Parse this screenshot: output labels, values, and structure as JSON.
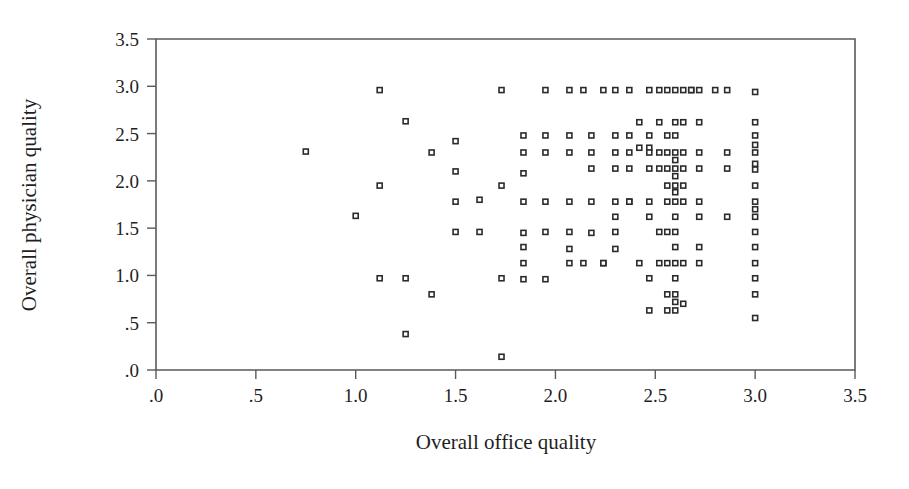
{
  "chart_data": {
    "type": "scatter",
    "title": "",
    "xlabel": "Overall office quality",
    "ylabel": "Overall physician quality",
    "xlim": [
      0,
      3.5
    ],
    "ylim": [
      0,
      3.5
    ],
    "xticks": [
      0,
      0.5,
      1.0,
      1.5,
      2.0,
      2.5,
      3.0,
      3.5
    ],
    "xticklabels": [
      ".0",
      ".5",
      "1.0",
      "1.5",
      "2.0",
      "2.5",
      "3.0",
      "3.5"
    ],
    "yticks": [
      0,
      0.5,
      1.0,
      1.5,
      2.0,
      2.5,
      3.0,
      3.5
    ],
    "yticklabels": [
      ".0",
      ".5",
      "1.0",
      "1.5",
      "2.0",
      "2.5",
      "3.0",
      "3.5"
    ],
    "grid": false,
    "legend": null,
    "marker": "open-square",
    "marker_size_px": 5,
    "marker_edge_color": "#2b2b2b",
    "marker_face_color": "#ffffff",
    "frame": "box",
    "frame_color": "#5a5a5a",
    "n_points": 196,
    "points": [
      [
        0.75,
        2.31
      ],
      [
        1.12,
        2.96
      ],
      [
        1.12,
        1.95
      ],
      [
        1.12,
        0.97
      ],
      [
        1.0,
        1.63
      ],
      [
        1.25,
        2.63
      ],
      [
        1.25,
        0.97
      ],
      [
        1.25,
        0.38
      ],
      [
        1.38,
        2.3
      ],
      [
        1.38,
        0.8
      ],
      [
        1.5,
        2.42
      ],
      [
        1.5,
        2.1
      ],
      [
        1.5,
        1.78
      ],
      [
        1.5,
        1.46
      ],
      [
        1.62,
        1.8
      ],
      [
        1.62,
        1.46
      ],
      [
        1.73,
        2.96
      ],
      [
        1.73,
        1.95
      ],
      [
        1.73,
        0.97
      ],
      [
        1.73,
        0.14
      ],
      [
        1.84,
        2.48
      ],
      [
        1.84,
        2.3
      ],
      [
        1.84,
        2.08
      ],
      [
        1.84,
        1.78
      ],
      [
        1.84,
        1.45
      ],
      [
        1.84,
        1.3
      ],
      [
        1.84,
        1.13
      ],
      [
        1.84,
        0.96
      ],
      [
        1.95,
        2.96
      ],
      [
        1.95,
        2.48
      ],
      [
        1.95,
        2.3
      ],
      [
        1.95,
        1.78
      ],
      [
        1.95,
        1.46
      ],
      [
        1.95,
        0.96
      ],
      [
        2.07,
        2.96
      ],
      [
        2.07,
        2.48
      ],
      [
        2.07,
        2.3
      ],
      [
        2.07,
        1.78
      ],
      [
        2.07,
        1.46
      ],
      [
        2.07,
        1.28
      ],
      [
        2.07,
        1.13
      ],
      [
        2.14,
        2.96
      ],
      [
        2.14,
        1.13
      ],
      [
        2.18,
        2.48
      ],
      [
        2.18,
        2.3
      ],
      [
        2.18,
        2.13
      ],
      [
        2.18,
        1.78
      ],
      [
        2.18,
        1.45
      ],
      [
        2.24,
        2.96
      ],
      [
        2.24,
        1.13
      ],
      [
        2.24,
        1.13
      ],
      [
        2.3,
        2.96
      ],
      [
        2.3,
        2.48
      ],
      [
        2.3,
        2.3
      ],
      [
        2.3,
        2.13
      ],
      [
        2.3,
        1.78
      ],
      [
        2.3,
        1.62
      ],
      [
        2.3,
        1.46
      ],
      [
        2.3,
        1.28
      ],
      [
        2.37,
        2.96
      ],
      [
        2.37,
        2.48
      ],
      [
        2.37,
        2.3
      ],
      [
        2.37,
        2.13
      ],
      [
        2.37,
        1.78
      ],
      [
        2.37,
        1.78
      ],
      [
        2.42,
        2.62
      ],
      [
        2.42,
        2.35
      ],
      [
        2.42,
        1.13
      ],
      [
        2.47,
        2.96
      ],
      [
        2.47,
        2.48
      ],
      [
        2.47,
        2.35
      ],
      [
        2.47,
        2.3
      ],
      [
        2.47,
        2.13
      ],
      [
        2.47,
        1.78
      ],
      [
        2.47,
        1.62
      ],
      [
        2.47,
        0.97
      ],
      [
        2.47,
        0.63
      ],
      [
        2.52,
        2.96
      ],
      [
        2.52,
        2.62
      ],
      [
        2.52,
        2.3
      ],
      [
        2.52,
        2.13
      ],
      [
        2.52,
        1.46
      ],
      [
        2.52,
        1.13
      ],
      [
        2.56,
        2.96
      ],
      [
        2.56,
        2.48
      ],
      [
        2.56,
        2.3
      ],
      [
        2.56,
        2.13
      ],
      [
        2.56,
        1.95
      ],
      [
        2.56,
        1.78
      ],
      [
        2.56,
        1.46
      ],
      [
        2.56,
        1.13
      ],
      [
        2.56,
        0.8
      ],
      [
        2.56,
        0.63
      ],
      [
        2.6,
        2.96
      ],
      [
        2.6,
        2.62
      ],
      [
        2.6,
        2.48
      ],
      [
        2.6,
        2.3
      ],
      [
        2.6,
        2.22
      ],
      [
        2.6,
        2.13
      ],
      [
        2.6,
        2.05
      ],
      [
        2.6,
        1.95
      ],
      [
        2.6,
        1.88
      ],
      [
        2.6,
        1.78
      ],
      [
        2.6,
        1.62
      ],
      [
        2.6,
        1.46
      ],
      [
        2.6,
        1.3
      ],
      [
        2.6,
        1.13
      ],
      [
        2.6,
        0.97
      ],
      [
        2.6,
        0.8
      ],
      [
        2.6,
        0.72
      ],
      [
        2.6,
        0.63
      ],
      [
        2.64,
        2.96
      ],
      [
        2.64,
        2.62
      ],
      [
        2.64,
        2.3
      ],
      [
        2.64,
        2.13
      ],
      [
        2.64,
        1.95
      ],
      [
        2.64,
        1.78
      ],
      [
        2.64,
        1.13
      ],
      [
        2.64,
        0.7
      ],
      [
        2.68,
        2.96
      ],
      [
        2.68,
        2.96
      ],
      [
        2.72,
        2.96
      ],
      [
        2.72,
        2.62
      ],
      [
        2.72,
        2.3
      ],
      [
        2.72,
        2.13
      ],
      [
        2.72,
        1.78
      ],
      [
        2.72,
        1.62
      ],
      [
        2.72,
        1.3
      ],
      [
        2.72,
        1.13
      ],
      [
        2.8,
        2.96
      ],
      [
        2.86,
        2.96
      ],
      [
        2.86,
        2.3
      ],
      [
        2.86,
        2.13
      ],
      [
        2.86,
        1.62
      ],
      [
        3.0,
        2.94
      ],
      [
        3.0,
        2.62
      ],
      [
        3.0,
        2.48
      ],
      [
        3.0,
        2.38
      ],
      [
        3.0,
        2.3
      ],
      [
        3.0,
        2.18
      ],
      [
        3.0,
        2.12
      ],
      [
        3.0,
        1.95
      ],
      [
        3.0,
        1.78
      ],
      [
        3.0,
        1.7
      ],
      [
        3.0,
        1.62
      ],
      [
        3.0,
        1.46
      ],
      [
        3.0,
        1.3
      ],
      [
        3.0,
        1.13
      ],
      [
        3.0,
        0.97
      ],
      [
        3.0,
        0.8
      ],
      [
        3.0,
        0.55
      ]
    ]
  },
  "axes": {
    "x_title": "Overall office quality",
    "y_title": "Overall physician quality",
    "x_tick_labels": [
      ".0",
      ".5",
      "1.0",
      "1.5",
      "2.0",
      "2.5",
      "3.0",
      "3.5"
    ],
    "y_tick_labels": [
      ".0",
      ".5",
      "1.0",
      "1.5",
      "2.0",
      "2.5",
      "3.0",
      "3.5"
    ]
  },
  "colors": {
    "background": "#ffffff",
    "axis": "#5a5a5a",
    "text": "#1f1f1f",
    "marker_edge": "#2b2b2b",
    "marker_face": "#ffffff"
  }
}
